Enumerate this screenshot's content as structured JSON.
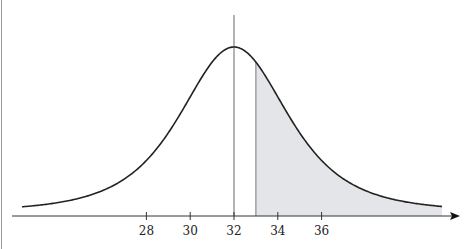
{
  "chart_data": {
    "type": "area",
    "title": "",
    "xlabel": "",
    "ylabel": "",
    "distribution": {
      "mean": 32,
      "shape": "symmetric bell curve"
    },
    "x_ticks": [
      28,
      30,
      32,
      34,
      36
    ],
    "x_tick_labels": [
      "28",
      "30",
      "32",
      "34",
      "36"
    ],
    "xlim": [
      27,
      37
    ],
    "mean_line_x": 32,
    "shaded_region": {
      "from": 33,
      "to": "right tail",
      "fill": "#e4e5e9"
    },
    "curve_color": "#222222",
    "axis_color": "#333333",
    "grid": false,
    "legend": null
  }
}
